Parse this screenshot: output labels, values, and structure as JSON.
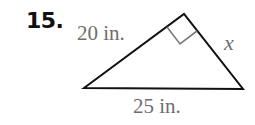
{
  "problem": {
    "number": "15."
  },
  "triangle": {
    "type": "right-triangle",
    "vertices": {
      "left": [
        84,
        88
      ],
      "top": [
        184,
        14
      ],
      "right": [
        243,
        89
      ]
    },
    "right_angle_at": "top",
    "sides": {
      "left_leg": "20 in.",
      "right_leg": "x",
      "hypotenuse": "25 in."
    }
  },
  "colors": {
    "stroke": "#111111",
    "marker": "#7a7a7a",
    "label": "#6e6e6e",
    "number": "#111111"
  }
}
